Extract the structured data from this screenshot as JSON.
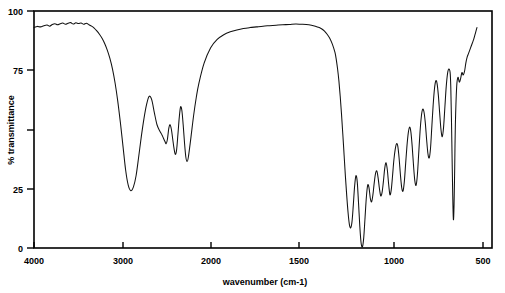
{
  "chart_data": {
    "type": "line",
    "title": "",
    "subtitle": "",
    "xlabel": "wavenumber (cm-1)",
    "ylabel": "% transmittance",
    "xlim": [
      4000,
      500
    ],
    "ylim": [
      0,
      100
    ],
    "x_inverted": true,
    "grid": false,
    "legend": null,
    "legend_position": "none",
    "xticks": [
      4000,
      3000,
      2000,
      1500,
      1000,
      500
    ],
    "xtick_labels": [
      "4000",
      "3000",
      "2000",
      "1500",
      "1000",
      "500"
    ],
    "yticks": [
      0,
      25,
      50,
      75,
      100
    ],
    "ytick_labels": [
      "0",
      "25",
      "",
      "75",
      "100"
    ],
    "series": [
      {
        "name": "IR transmittance",
        "color": "#111111",
        "x": [
          4000,
          3975,
          3950,
          3925,
          3900,
          3880,
          3860,
          3840,
          3820,
          3800,
          3780,
          3760,
          3740,
          3720,
          3700,
          3680,
          3660,
          3640,
          3620,
          3600,
          3580,
          3560,
          3540,
          3520,
          3500,
          3480,
          3460,
          3440,
          3420,
          3400,
          3380,
          3360,
          3340,
          3320,
          3300,
          3280,
          3260,
          3240,
          3220,
          3200,
          3180,
          3160,
          3140,
          3120,
          3100,
          3080,
          3060,
          3040,
          3020,
          3000,
          2990,
          2980,
          2970,
          2960,
          2950,
          2940,
          2930,
          2920,
          2910,
          2900,
          2890,
          2880,
          2870,
          2860,
          2850,
          2840,
          2830,
          2820,
          2800,
          2780,
          2760,
          2740,
          2700,
          2650,
          2600,
          2550,
          2500,
          2450,
          2400,
          2350,
          2300,
          2250,
          2200,
          2150,
          2100,
          2050,
          2000,
          1960,
          1920,
          1880,
          1850,
          1820,
          1800,
          1780,
          1760,
          1740,
          1720,
          1700,
          1690,
          1680,
          1670,
          1660,
          1650,
          1640,
          1630,
          1620,
          1610,
          1600,
          1590,
          1580,
          1570,
          1560,
          1550,
          1540,
          1530,
          1520,
          1510,
          1500,
          1490,
          1480,
          1470,
          1460,
          1450,
          1440,
          1430,
          1420,
          1410,
          1400,
          1390,
          1380,
          1370,
          1360,
          1350,
          1340,
          1330,
          1320,
          1310,
          1300,
          1290,
          1280,
          1270,
          1260,
          1250,
          1240,
          1230,
          1220,
          1210,
          1200,
          1190,
          1180,
          1170,
          1160,
          1150,
          1140,
          1130,
          1120,
          1110,
          1100,
          1090,
          1080,
          1070,
          1060,
          1050,
          1040,
          1030,
          1020,
          1010,
          1000,
          990,
          980,
          970,
          960,
          950,
          940,
          930,
          920,
          910,
          900,
          890,
          880,
          870,
          860,
          850,
          840,
          830,
          820,
          815,
          810,
          805,
          800,
          795,
          790,
          785,
          780,
          770,
          760,
          750,
          740,
          730,
          720,
          710,
          700,
          690,
          680,
          670,
          660,
          650,
          640,
          630,
          620,
          615
        ],
        "y": [
          93,
          93.5,
          93.3,
          93.8,
          94.1,
          93.6,
          94.3,
          94.6,
          94.2,
          94.6,
          94.9,
          94.4,
          94.8,
          95.1,
          94.5,
          95.0,
          94.7,
          94.9,
          94.4,
          94.8,
          94.2,
          93.6,
          92.8,
          91.6,
          90.2,
          88.5,
          86.3,
          83.5,
          80.0,
          75.5,
          69.5,
          62.0,
          53.0,
          43.0,
          33.0,
          26.5,
          24.2,
          25.8,
          30.5,
          38.5,
          47.0,
          54.5,
          60.5,
          64.0,
          62.5,
          57.0,
          52.0,
          49.5,
          47.5,
          45.0,
          44.0,
          46.0,
          50.5,
          52.0,
          50.0,
          46.0,
          42.0,
          39.5,
          41.5,
          48.0,
          55.0,
          59.5,
          58.0,
          52.0,
          44.5,
          38.5,
          36.5,
          38.5,
          47.0,
          56.0,
          63.5,
          69.5,
          78.0,
          84.5,
          88.0,
          90.0,
          91.2,
          92.0,
          92.6,
          93.0,
          93.3,
          93.6,
          93.8,
          94.0,
          94.2,
          94.3,
          94.5,
          94.4,
          94.3,
          94.0,
          93.6,
          93.0,
          92.4,
          91.5,
          90.2,
          88.5,
          86.0,
          82.5,
          79.5,
          75.5,
          70.5,
          64.0,
          56.5,
          48.0,
          39.0,
          30.0,
          22.0,
          15.0,
          10.0,
          8.5,
          11.0,
          18.0,
          26.0,
          30.5,
          28.0,
          19.0,
          9.0,
          2.0,
          0.5,
          4.5,
          13.0,
          21.5,
          26.5,
          25.5,
          21.0,
          19.5,
          22.5,
          27.5,
          31.5,
          32.5,
          29.5,
          25.0,
          22.0,
          23.5,
          28.0,
          33.5,
          36.0,
          33.0,
          27.0,
          22.5,
          24.5,
          30.5,
          37.0,
          41.5,
          44.0,
          43.0,
          38.0,
          31.0,
          25.5,
          24.0,
          28.0,
          35.5,
          43.0,
          48.5,
          51.0,
          49.0,
          43.0,
          35.0,
          28.5,
          26.5,
          31.0,
          40.0,
          49.0,
          55.5,
          58.5,
          57.5,
          53.0,
          46.0,
          40.0,
          38.0,
          42.0,
          51.0,
          60.0,
          67.0,
          70.5,
          69.5,
          64.5,
          57.0,
          50.0,
          47.0,
          51.0,
          59.5,
          68.0,
          73.5,
          75.5,
          74.0,
          68.0,
          55.0,
          38.0,
          22.0,
          12.0,
          18.0,
          34.0,
          52.0,
          68.0,
          72.0,
          70.0,
          71.5,
          74.0,
          73.0,
          74.5,
          78.0,
          80.5,
          82.0,
          83.5,
          85.0,
          86.5,
          88.0,
          90.0,
          92.0,
          93.0
        ]
      }
    ],
    "annotations": [
      {
        "label": "broad O-H / N-H stretch",
        "x": 3260,
        "y": 24
      },
      {
        "label": "C-H stretch",
        "x": 2920,
        "y": 39
      },
      {
        "label": "strong band",
        "x": 1500,
        "y": 0.5
      },
      {
        "label": "sharp fingerprint band",
        "x": 800,
        "y": 12
      }
    ]
  },
  "axes": {
    "x_title": "wavenumber (cm-1)",
    "y_title": "% transmittance",
    "x_tick_labels": [
      "4000",
      "3000",
      "2000",
      "1500",
      "1000",
      "500"
    ],
    "y_tick_labels": [
      "100",
      "75",
      "25",
      "0"
    ]
  }
}
